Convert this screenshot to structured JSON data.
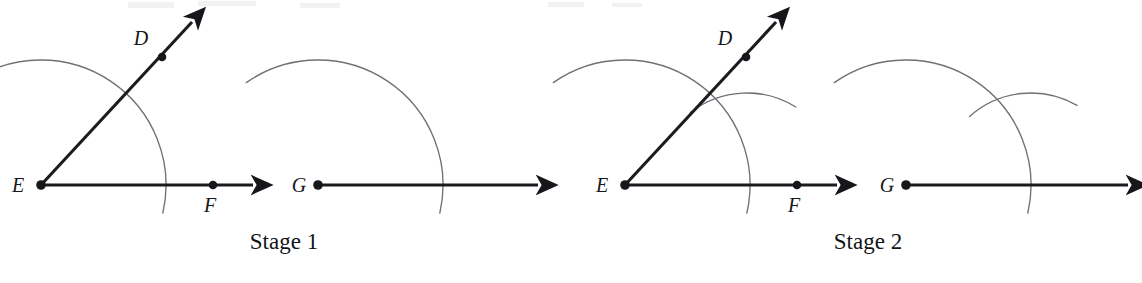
{
  "figure": {
    "type": "geometric-construction",
    "background_color": "#ffffff",
    "ink_color": "#15171a",
    "arc_color": "#6e7175",
    "stages": [
      {
        "caption": "Stage 1",
        "caption_x": 284,
        "caption_y": 249,
        "panels": [
          {
            "name": "original-angle-panel",
            "vertex_label": "E",
            "vertex_label_x": 18,
            "vertex_label_y": 192,
            "vertex_x": 41,
            "vertex_y": 185,
            "upper_ray": {
              "point_label": "D",
              "point_label_x": 138,
              "point_label_y": 45,
              "point_x": 162,
              "point_y": 57,
              "tip_x": 192,
              "tip_y": 22
            },
            "lower_ray": {
              "point_label": "F",
              "point_label_x": 205,
              "point_label_y": 210,
              "point_x": 213,
              "point_y": 185,
              "tip_x": 253,
              "tip_y": 185
            },
            "arcs": [
              {
                "name": "vertex-arc",
                "center_x": 41,
                "center_y": 185,
                "radius": 125,
                "start_deg": 125,
                "end_deg": -13
              }
            ]
          },
          {
            "name": "copy-target-panel",
            "vertex_label": "G",
            "vertex_label_x": 296,
            "vertex_label_y": 192,
            "vertex_x": 318,
            "vertex_y": 185,
            "lower_ray": {
              "point_label": "",
              "tip_x": 538,
              "tip_y": 185
            },
            "arcs": [
              {
                "name": "vertex-arc",
                "center_x": 318,
                "center_y": 185,
                "radius": 125,
                "start_deg": 125,
                "end_deg": -13
              }
            ]
          }
        ]
      },
      {
        "caption": "Stage 2",
        "caption_x": 868,
        "caption_y": 249,
        "panels": [
          {
            "name": "original-angle-panel",
            "vertex_label": "E",
            "vertex_label_x": 602,
            "vertex_label_y": 192,
            "vertex_x": 625,
            "vertex_y": 185,
            "upper_ray": {
              "point_label": "D",
              "point_label_x": 722,
              "point_label_y": 45,
              "point_x": 746,
              "point_y": 57,
              "tip_x": 776,
              "tip_y": 22
            },
            "lower_ray": {
              "point_label": "F",
              "point_label_x": 789,
              "point_label_y": 210,
              "point_x": 797,
              "point_y": 185,
              "tip_x": 837,
              "tip_y": 185
            },
            "arcs": [
              {
                "name": "vertex-arc",
                "center_x": 625,
                "center_y": 185,
                "radius": 125,
                "start_deg": 125,
                "end_deg": -13
              },
              {
                "name": "chord-measure-arc",
                "center_x": 747,
                "center_y": 185,
                "radius": 92,
                "start_deg": 128,
                "end_deg": 58
              }
            ]
          },
          {
            "name": "copy-target-panel",
            "vertex_label": "G",
            "vertex_label_x": 884,
            "vertex_label_y": 192,
            "vertex_x": 906,
            "vertex_y": 185,
            "lower_ray": {
              "point_label": "",
              "tip_x": 1128,
              "tip_y": 185
            },
            "arcs": [
              {
                "name": "vertex-arc",
                "center_x": 906,
                "center_y": 185,
                "radius": 125,
                "start_deg": 125,
                "end_deg": -13
              },
              {
                "name": "chord-measure-arc",
                "center_x": 1031,
                "center_y": 185,
                "radius": 92,
                "start_deg": 132,
                "end_deg": 60
              }
            ]
          }
        ]
      }
    ]
  }
}
